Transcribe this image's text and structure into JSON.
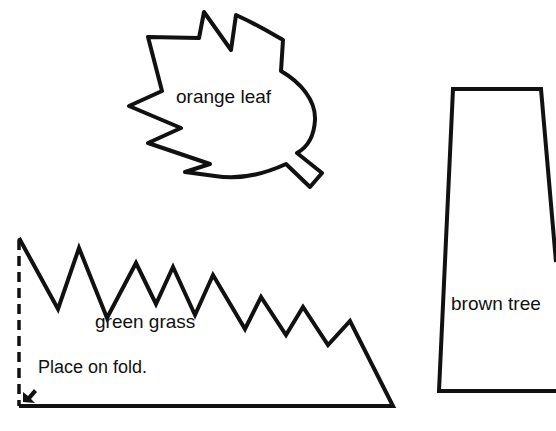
{
  "shapes": {
    "leaf": {
      "label": "orange leaf"
    },
    "grass": {
      "label": "green grass",
      "fold_note": "Place on fold."
    },
    "tree": {
      "label": "brown tree"
    }
  },
  "colors": {
    "stroke": "#111111",
    "background": "#ffffff"
  }
}
